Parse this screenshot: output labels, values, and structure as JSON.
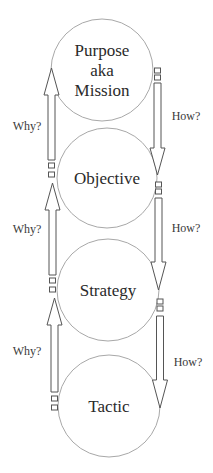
{
  "diagram": {
    "colors": {
      "circle_stroke": "#a8a8a8",
      "arrow_stroke": "#555555",
      "text": "#2a2a2a",
      "background": "#ffffff"
    },
    "nodes": [
      {
        "id": "purpose",
        "lines": [
          "Purpose",
          "aka",
          "Mission"
        ],
        "cx": 102,
        "cy": 70,
        "r": 51
      },
      {
        "id": "objective",
        "lines": [
          "Objective"
        ],
        "cx": 107,
        "cy": 178,
        "r": 50
      },
      {
        "id": "strategy",
        "lines": [
          "Strategy"
        ],
        "cx": 108,
        "cy": 290,
        "r": 51
      },
      {
        "id": "tactic",
        "lines": [
          "Tactic"
        ],
        "cx": 109,
        "cy": 406,
        "r": 51
      }
    ],
    "why_arrows": [
      {
        "label": "Why?",
        "from": "objective",
        "to": "purpose",
        "x": 51.5,
        "tip_y": 68,
        "head_base_y": 95,
        "tail_y": 160,
        "label_x": 27,
        "label_y": 130,
        "markers_y": [
          163,
          172
        ]
      },
      {
        "label": "Why?",
        "from": "strategy",
        "to": "objective",
        "x": 52.5,
        "tip_y": 183,
        "head_base_y": 210,
        "tail_y": 275,
        "label_x": 27,
        "label_y": 233,
        "markers_y": [
          278,
          287
        ]
      },
      {
        "label": "Why?",
        "from": "tactic",
        "to": "strategy",
        "x": 54.5,
        "tip_y": 298,
        "head_base_y": 325,
        "tail_y": 392,
        "label_x": 27,
        "label_y": 355,
        "markers_y": [
          396,
          405
        ]
      }
    ],
    "how_arrows": [
      {
        "label": "How?",
        "from": "purpose",
        "to": "objective",
        "x": 157.5,
        "tail_y": 83,
        "head_base_y": 148,
        "tip_y": 175,
        "label_x": 186,
        "label_y": 120,
        "markers_y": [
          68,
          75
        ]
      },
      {
        "label": "How?",
        "from": "objective",
        "to": "strategy",
        "x": 158.5,
        "tail_y": 198,
        "head_base_y": 262,
        "tip_y": 290,
        "label_x": 186,
        "label_y": 232,
        "markers_y": [
          182,
          189
        ]
      },
      {
        "label": "How?",
        "from": "strategy",
        "to": "tactic",
        "x": 160,
        "tail_y": 316,
        "head_base_y": 380,
        "tip_y": 408,
        "label_x": 188,
        "label_y": 366,
        "markers_y": [
          299,
          306
        ]
      }
    ]
  }
}
